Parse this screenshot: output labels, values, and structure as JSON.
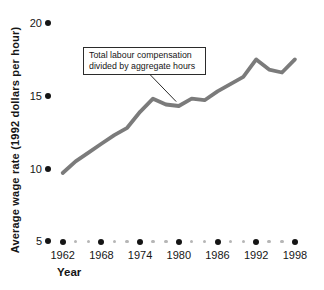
{
  "figure": {
    "ylabel": "Average wage rate (1992 dollars per hour)",
    "xlabel": "Year",
    "annotation": {
      "line1": "Total labour compensation",
      "line2": "divided by aggregate hours"
    }
  },
  "chart_data": {
    "type": "line",
    "title": "",
    "xlabel": "Year",
    "ylabel": "Average wage rate (1992 dollars per hour)",
    "x": [
      1962,
      1964,
      1966,
      1968,
      1970,
      1972,
      1974,
      1976,
      1978,
      1980,
      1982,
      1984,
      1986,
      1988,
      1990,
      1992,
      1994,
      1996,
      1998
    ],
    "values": [
      9.7,
      10.5,
      11.1,
      11.7,
      12.3,
      12.8,
      13.9,
      14.8,
      14.4,
      14.3,
      14.8,
      14.7,
      15.3,
      15.8,
      16.3,
      17.5,
      16.8,
      16.6,
      17.5
    ],
    "xlim": [
      1962,
      1998
    ],
    "ylim": [
      5,
      20
    ],
    "yticks": [
      20,
      15,
      10,
      5
    ],
    "xticks_major": [
      1962,
      1968,
      1974,
      1980,
      1986,
      1992,
      1998
    ],
    "xticks_minor": [
      1964,
      1966,
      1970,
      1972,
      1976,
      1978,
      1982,
      1984,
      1988,
      1990,
      1994,
      1996
    ],
    "grid": false,
    "legend": "none",
    "annotation": {
      "text": "Total labour compensation divided by aggregate hours",
      "target_year": 1979.6,
      "target_value": 14.6
    }
  },
  "colors": {
    "line": "#7b7b7b",
    "major_dot": "#151515",
    "minor_dot": "#b6b6b6",
    "text": "#161616",
    "callout_border": "#2b2b2b",
    "callout_bg": "#fffffe"
  }
}
